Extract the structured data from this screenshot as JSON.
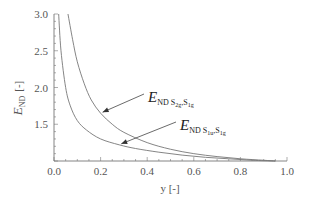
{
  "chart_data": {
    "type": "line",
    "title": "",
    "xlabel": "y [-]",
    "ylabel": "E_ND [-]",
    "xlim": [
      0.0,
      1.0
    ],
    "ylim": [
      1.0,
      3.0
    ],
    "grid": false,
    "x_ticks": [
      "0.0",
      "0.2",
      "0.4",
      "0.6",
      "0.8",
      "1.0"
    ],
    "y_ticks": [
      "1.5",
      "2.0",
      "2.5",
      "3.0"
    ],
    "ylabel_main": "E",
    "ylabel_sub": "ND",
    "ylabel_unit": "[-]",
    "series": [
      {
        "name": "E_ND S2g,S1g",
        "label_main": "E",
        "label_sub": "ND S",
        "label_sub2": "2g",
        "label_sub3": ",S",
        "label_sub4": "1g",
        "x": [
          0.06,
          0.08,
          0.1,
          0.13,
          0.16,
          0.2,
          0.25,
          0.3,
          0.4,
          0.5,
          0.6,
          0.7,
          0.8,
          0.9,
          0.95
        ],
        "values": [
          3.0,
          2.65,
          2.35,
          2.05,
          1.83,
          1.65,
          1.5,
          1.39,
          1.25,
          1.16,
          1.1,
          1.06,
          1.03,
          1.01,
          1.0
        ],
        "arrow_target": [
          0.2,
          1.65
        ]
      },
      {
        "name": "E_ND S1u,S1g",
        "label_main": "E",
        "label_sub": "ND S",
        "label_sub2": "1u",
        "label_sub3": ",S",
        "label_sub4": "1g",
        "x": [
          0.02,
          0.03,
          0.05,
          0.07,
          0.1,
          0.14,
          0.2,
          0.28,
          0.35,
          0.45,
          0.55,
          0.65,
          0.75,
          0.85,
          0.95
        ],
        "values": [
          3.0,
          2.5,
          2.0,
          1.75,
          1.55,
          1.42,
          1.3,
          1.22,
          1.17,
          1.12,
          1.08,
          1.05,
          1.03,
          1.01,
          1.0
        ],
        "arrow_target": [
          0.28,
          1.22
        ]
      }
    ]
  }
}
